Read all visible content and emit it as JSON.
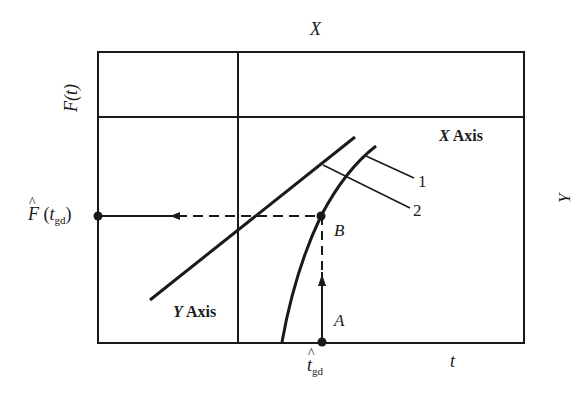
{
  "diagram": {
    "type": "graphical-method-schematic",
    "top_label": "X",
    "right_label": "Y",
    "left_axis_label": "F(t)",
    "bottom_axis_label": "t",
    "x_axis_name": {
      "letter": "X",
      "word": "Axis"
    },
    "y_axis_name": {
      "letter": "Y",
      "word": "Axis"
    },
    "curve_labels": [
      "1",
      "2"
    ],
    "points": {
      "A": "A",
      "B": "B"
    },
    "left_point_label": {
      "hat": "^",
      "main": "F",
      "open": "(",
      "var": "t",
      "sub": "gd",
      "close": ")"
    },
    "bottom_point_label": {
      "hat": "^",
      "var": "t",
      "sub": "gd"
    },
    "colors": {
      "line": "#1a1a1a",
      "background": "#ffffff"
    }
  }
}
